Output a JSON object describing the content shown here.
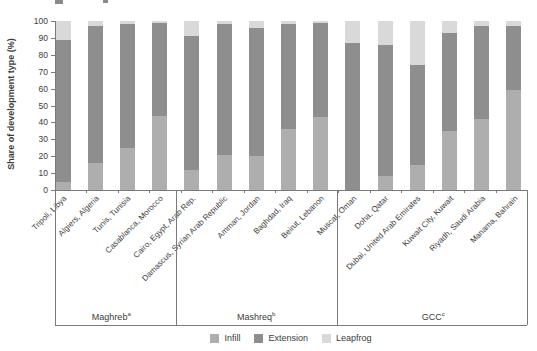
{
  "figure": {
    "y_axis_label": "Share of development type (%)"
  },
  "chart_data": {
    "type": "bar",
    "stacked": true,
    "orientation": "vertical",
    "title": "",
    "xlabel": "",
    "ylabel": "Share of development type (%)",
    "ylim": [
      0,
      100
    ],
    "yticks": [
      0,
      10,
      20,
      30,
      40,
      50,
      60,
      70,
      80,
      90,
      100
    ],
    "grid": false,
    "legend_position": "bottom",
    "categories": [
      "Tripoli, Libya",
      "Algiers, Algeria",
      "Tunis, Tunisia",
      "Casablanca, Morocco",
      "Cairo, Egypt, Arab Rep.",
      "Damascus, Syrian Arab Republic",
      "Amman, Jordan",
      "Baghdad, Iraq",
      "Beirut, Lebanon",
      "Muscat, Oman",
      "Doha, Qatar",
      "Dubai, United Arab Emirates",
      "Kuwait City, Kuwait",
      "Riyadh, Saudi Arabia",
      "Manama, Bahrain"
    ],
    "groups": [
      {
        "label": "Maghreb",
        "footnote_marker": "a",
        "start": 0,
        "end": 3
      },
      {
        "label": "Mashreq",
        "footnote_marker": "b",
        "start": 4,
        "end": 8
      },
      {
        "label": "GCC",
        "footnote_marker": "c",
        "start": 9,
        "end": 14
      }
    ],
    "series": [
      {
        "name": "Infill",
        "color": "#aeaeae",
        "values": [
          5,
          16,
          25,
          44,
          12,
          21,
          20,
          36,
          43,
          0,
          8,
          15,
          35,
          42,
          59
        ]
      },
      {
        "name": "Extension",
        "color": "#8e8e8e",
        "values": [
          84,
          81,
          73,
          55,
          79,
          77,
          76,
          62,
          56,
          87,
          78,
          59,
          58,
          55,
          38
        ]
      },
      {
        "name": "Leapfrog",
        "color": "#d9d9d9",
        "values": [
          11,
          3,
          2,
          1,
          9,
          2,
          4,
          2,
          1,
          13,
          14,
          26,
          7,
          3,
          3
        ]
      }
    ]
  }
}
